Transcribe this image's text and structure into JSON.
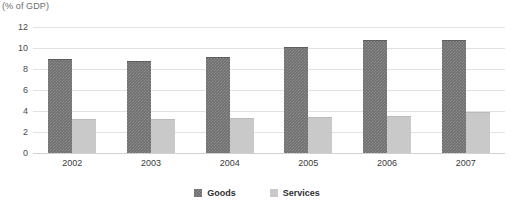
{
  "chart_data": {
    "type": "bar",
    "title": "",
    "subtitle": "",
    "unit_caption": "(% of GDP)",
    "categories": [
      "2002",
      "2003",
      "2004",
      "2005",
      "2006",
      "2007"
    ],
    "series": [
      {
        "name": "Goods",
        "color": "#6e6e6e",
        "values": [
          9.0,
          8.8,
          9.1,
          10.1,
          10.8,
          10.8
        ]
      },
      {
        "name": "Services",
        "color": "#c9c9c9",
        "values": [
          3.2,
          3.25,
          3.3,
          3.45,
          3.55,
          3.9
        ]
      }
    ],
    "xlabel": "",
    "ylabel": "",
    "ylim": [
      0,
      12
    ],
    "ytick_values": [
      12,
      10,
      8,
      6,
      4,
      2,
      0
    ],
    "ytick_labels": [
      "12",
      "10",
      "8",
      "6",
      "4",
      "2",
      "0"
    ],
    "grid": true,
    "legend_position": "bottom-center",
    "grouping": "grouped"
  },
  "legend": {
    "items": [
      {
        "label": "Goods"
      },
      {
        "label": "Services"
      }
    ]
  },
  "colors": {
    "gridline": "#e2e2e2",
    "baseline": "#d2d2d2",
    "background": "#ffffff",
    "text": "#3b3b3b",
    "caption_text": "#6d6d6d"
  }
}
